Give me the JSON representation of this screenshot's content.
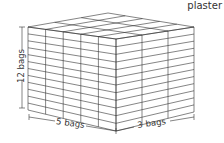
{
  "title": "plaster",
  "diagram": {
    "type": "stacked-bags-box",
    "dimensions": {
      "height": {
        "label": "12 bags",
        "count": 12
      },
      "width": {
        "label": "5 bags",
        "count": 5
      },
      "depth": {
        "label": "3 bags",
        "count": 3
      }
    },
    "line_color": "#333333"
  }
}
